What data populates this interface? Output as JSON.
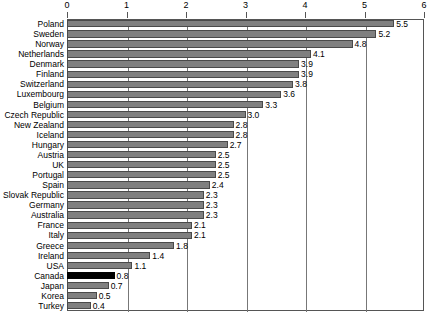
{
  "chart_data": {
    "type": "bar",
    "orientation": "horizontal",
    "title": "",
    "subtitle": "",
    "xlabel": "",
    "ylabel": "",
    "xlim": [
      0,
      6
    ],
    "xticks": [
      0,
      1,
      2,
      3,
      4,
      5,
      6
    ],
    "xtick_labels": [
      "0",
      "1",
      "2",
      "3",
      "4",
      "5",
      "6"
    ],
    "grid": true,
    "legend": false,
    "legend_position": "none",
    "highlight_category": "Canada",
    "highlight_color": "#000000",
    "bar_color": "#808080",
    "bar_edge_color": "#4a4a4a",
    "categories": [
      "Poland",
      "Sweden",
      "Norway",
      "Netherlands",
      "Denmark",
      "Finland",
      "Switzerland",
      "Luxembourg",
      "Belgium",
      "Czech Republic",
      "New Zealand",
      "Iceland",
      "Hungary",
      "Austria",
      "UK",
      "Portugal",
      "Spain",
      "Slovak Republic",
      "Germany",
      "Australia",
      "France",
      "Italy",
      "Greece",
      "Ireland",
      "USA",
      "Canada",
      "Japan",
      "Korea",
      "Turkey"
    ],
    "values": [
      5.5,
      5.2,
      4.8,
      4.1,
      3.9,
      3.9,
      3.8,
      3.6,
      3.3,
      3.0,
      2.8,
      2.8,
      2.7,
      2.5,
      2.5,
      2.5,
      2.4,
      2.3,
      2.3,
      2.3,
      2.1,
      2.1,
      1.8,
      1.4,
      1.1,
      0.8,
      0.7,
      0.5,
      0.4
    ],
    "value_labels": [
      "5.5",
      "5.2",
      "4.8",
      "4.1",
      "3.9",
      "3.9",
      "3.8",
      "3.6",
      "3.3",
      "3.0",
      "2.8",
      "2.8",
      "2.7",
      "2.5",
      "2.5",
      "2.5",
      "2.4",
      "2.3",
      "2.3",
      "2.3",
      "2.1",
      "2.1",
      "1.8",
      "1.4",
      "1.1",
      "0.8",
      "0.7",
      "0.5",
      "0.4"
    ]
  }
}
